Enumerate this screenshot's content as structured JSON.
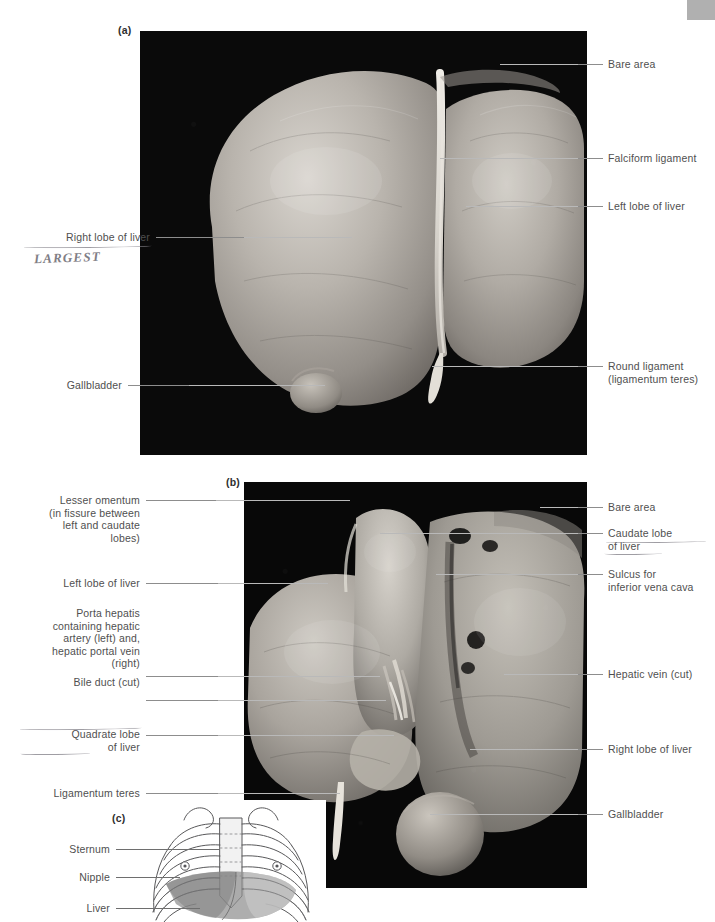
{
  "figure": {
    "panels": [
      {
        "tag": "(a)",
        "caption_view": "anterior surface of liver"
      },
      {
        "tag": "(b)",
        "caption_view": "posterior / visceral surface of liver"
      },
      {
        "tag": "(c)",
        "caption_view": "surface projection of liver on thoracic cage"
      }
    ]
  },
  "colors": {
    "leader": "#8d8d8d",
    "leader_light": "#b9b9b9",
    "text": "#4f4f4f",
    "pencil": "#8f8d94",
    "photo_background": "#090909",
    "liver_shade_dark": "#8b8b8b",
    "liver_shade_light": "#c9c9c9",
    "rib_outline": "#58585a",
    "page": "#ffffff"
  },
  "panel_a": {
    "tag": "(a)",
    "labels_left": [
      {
        "text": "Right lobe of liver",
        "annotated": true
      },
      {
        "text": "Gallbladder",
        "annotated": false
      }
    ],
    "labels_right": [
      {
        "text": "Bare area"
      },
      {
        "text": "Falciform ligament"
      },
      {
        "text": "Left lobe of liver"
      },
      {
        "text": "Round ligament\n(ligamentum teres)"
      }
    ],
    "handwritten_note": "LARGEST"
  },
  "panel_b": {
    "tag": "(b)",
    "labels_left": [
      {
        "text": "Lesser omentum\n(in fissure between\nleft and caudate\nlobes)",
        "underlined": false
      },
      {
        "text": "Left lobe of liver",
        "underlined": false
      },
      {
        "text": "Porta hepatis\ncontaining hepatic\nartery (left) and,\nhepatic portal vein\n(right)",
        "underlined": false
      },
      {
        "text": "Bile duct (cut)",
        "underlined": false
      },
      {
        "text": "Quadrate lobe\nof liver",
        "underlined": true
      },
      {
        "text": "Ligamentum teres",
        "underlined": false
      }
    ],
    "labels_right": [
      {
        "text": "Bare area",
        "underlined": false
      },
      {
        "text": "Caudate lobe\nof liver",
        "underlined": true
      },
      {
        "text": "Sulcus for\ninferior vena cava",
        "underlined": false
      },
      {
        "text": "Hepatic vein (cut)",
        "underlined": false
      },
      {
        "text": "Right lobe of liver",
        "underlined": false
      },
      {
        "text": "Gallbladder",
        "underlined": false
      }
    ]
  },
  "panel_c": {
    "tag": "(c)",
    "labels_left": [
      {
        "text": "Sternum"
      },
      {
        "text": "Nipple"
      },
      {
        "text": "Liver"
      }
    ],
    "drawing": {
      "type": "line-drawing",
      "subject": "anterior thoracic cage with liver projection",
      "rib_pairs": 10,
      "nipple_markers": 2
    }
  }
}
